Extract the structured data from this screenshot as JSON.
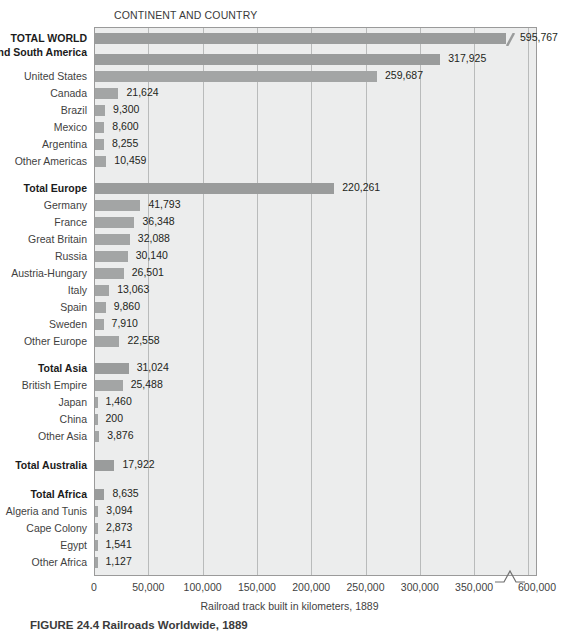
{
  "header": {
    "column_header": "CONTINENT AND COUNTRY"
  },
  "axis": {
    "title": "Railroad track built in kilometers, 1889",
    "tick_labels": [
      "0",
      "50,000",
      "100,000",
      "150,000",
      "200,000",
      "250,000",
      "300,000",
      "350,000",
      "600,000"
    ],
    "has_break": true,
    "break_between": [
      "350,000",
      "600,000"
    ]
  },
  "caption": {
    "text": "FIGURE 24.4  Railroads Worldwide, 1889"
  },
  "chart_data": {
    "type": "bar",
    "orientation": "horizontal",
    "title": "CONTINENT AND COUNTRY",
    "xlabel": "Railroad track built in kilometers, 1889",
    "ylabel": "",
    "xlim": [
      0,
      360000
    ],
    "axis_break": {
      "from": 355000,
      "to": 595000,
      "display_max_label": "600,000"
    },
    "grid": "vertical",
    "legend": "none",
    "xticks": [
      0,
      50000,
      100000,
      150000,
      200000,
      250000,
      300000,
      350000,
      600000
    ],
    "categories": [
      "TOTAL WORLD",
      "Total North and South America",
      "United States",
      "Canada",
      "Brazil",
      "Mexico",
      "Argentina",
      "Other Americas",
      "Total Europe",
      "Germany",
      "France",
      "Great Britain",
      "Russia",
      "Austria-Hungary",
      "Italy",
      "Spain",
      "Sweden",
      "Other Europe",
      "Total Asia",
      "British Empire",
      "Japan",
      "China",
      "Other Asia",
      "Total Australia",
      "Total Africa",
      "Algeria and Tunis",
      "Cape Colony",
      "Egypt",
      "Other Africa"
    ],
    "values": [
      595767,
      317925,
      259687,
      21624,
      9300,
      8600,
      8255,
      10459,
      220261,
      41793,
      36348,
      32088,
      30140,
      26501,
      13063,
      9860,
      7910,
      22558,
      31024,
      25488,
      1460,
      200,
      3876,
      17922,
      8635,
      3094,
      2873,
      1541,
      1127
    ],
    "value_labels": [
      "595,767",
      "317,925",
      "259,687",
      "21,624",
      "9,300",
      "8,600",
      "8,255",
      "10,459",
      "220,261",
      "41,793",
      "36,348",
      "32,088",
      "30,140",
      "26,501",
      "13,063",
      "9,860",
      "7,910",
      "22,558",
      "31,024",
      "25,488",
      "1,460",
      "200",
      "3,876",
      "17,922",
      "8,635",
      "3,094",
      "2,873",
      "1,541",
      "1,127"
    ],
    "colors": {
      "bar": "#a3a5a5",
      "total_bar": "#9a9c9c",
      "plot_background": "#eceded",
      "gridline": "#b9bbbb",
      "frame": "#9a9a9a",
      "text": "#231f20"
    }
  },
  "rows": [
    {
      "label": "TOTAL WORLD",
      "value_label": "595,767",
      "value": 595767,
      "bold": true,
      "truncated": true,
      "gap_before": 0
    },
    {
      "label": "Total North and South America",
      "value_label": "317,925",
      "value": 317925,
      "bold": true,
      "truncated": false,
      "gap_before": 4,
      "two_line": true
    },
    {
      "label": "United States",
      "value_label": "259,687",
      "value": 259687,
      "bold": false,
      "truncated": false,
      "gap_before": 0
    },
    {
      "label": "Canada",
      "value_label": "21,624",
      "value": 21624,
      "bold": false,
      "truncated": false,
      "gap_before": 0
    },
    {
      "label": "Brazil",
      "value_label": "9,300",
      "value": 9300,
      "bold": false,
      "truncated": false,
      "gap_before": 0
    },
    {
      "label": "Mexico",
      "value_label": "8,600",
      "value": 8600,
      "bold": false,
      "truncated": false,
      "gap_before": 0
    },
    {
      "label": "Argentina",
      "value_label": "8,255",
      "value": 8255,
      "bold": false,
      "truncated": false,
      "gap_before": 0
    },
    {
      "label": "Other Americas",
      "value_label": "10,459",
      "value": 10459,
      "bold": false,
      "truncated": false,
      "gap_before": 0
    },
    {
      "label": "Total Europe",
      "value_label": "220,261",
      "value": 220261,
      "bold": true,
      "truncated": false,
      "gap_before": 10
    },
    {
      "label": "Germany",
      "value_label": "41,793",
      "value": 41793,
      "bold": false,
      "truncated": false,
      "gap_before": 0
    },
    {
      "label": "France",
      "value_label": "36,348",
      "value": 36348,
      "bold": false,
      "truncated": false,
      "gap_before": 0
    },
    {
      "label": "Great Britain",
      "value_label": "32,088",
      "value": 32088,
      "bold": false,
      "truncated": false,
      "gap_before": 0
    },
    {
      "label": "Russia",
      "value_label": "30,140",
      "value": 30140,
      "bold": false,
      "truncated": false,
      "gap_before": 0
    },
    {
      "label": "Austria-Hungary",
      "value_label": "26,501",
      "value": 26501,
      "bold": false,
      "truncated": false,
      "gap_before": 0
    },
    {
      "label": "Italy",
      "value_label": "13,063",
      "value": 13063,
      "bold": false,
      "truncated": false,
      "gap_before": 0
    },
    {
      "label": "Spain",
      "value_label": "9,860",
      "value": 9860,
      "bold": false,
      "truncated": false,
      "gap_before": 0
    },
    {
      "label": "Sweden",
      "value_label": "7,910",
      "value": 7910,
      "bold": false,
      "truncated": false,
      "gap_before": 0
    },
    {
      "label": "Other Europe",
      "value_label": "22,558",
      "value": 22558,
      "bold": false,
      "truncated": false,
      "gap_before": 0
    },
    {
      "label": "Total Asia",
      "value_label": "31,024",
      "value": 31024,
      "bold": true,
      "truncated": false,
      "gap_before": 10
    },
    {
      "label": "British Empire",
      "value_label": "25,488",
      "value": 25488,
      "bold": false,
      "truncated": false,
      "gap_before": 0
    },
    {
      "label": "Japan",
      "value_label": "1,460",
      "value": 1460,
      "bold": false,
      "truncated": false,
      "gap_before": 0
    },
    {
      "label": "China",
      "value_label": "200",
      "value": 200,
      "bold": false,
      "truncated": false,
      "gap_before": 0
    },
    {
      "label": "Other Asia",
      "value_label": "3,876",
      "value": 3876,
      "bold": false,
      "truncated": false,
      "gap_before": 0
    },
    {
      "label": "Total Australia",
      "value_label": "17,922",
      "value": 17922,
      "bold": true,
      "truncated": false,
      "gap_before": 12
    },
    {
      "label": "Total Africa",
      "value_label": "8,635",
      "value": 8635,
      "bold": true,
      "truncated": false,
      "gap_before": 12
    },
    {
      "label": "Algeria and Tunis",
      "value_label": "3,094",
      "value": 3094,
      "bold": false,
      "truncated": false,
      "gap_before": 0
    },
    {
      "label": "Cape Colony",
      "value_label": "2,873",
      "value": 2873,
      "bold": false,
      "truncated": false,
      "gap_before": 0
    },
    {
      "label": "Egypt",
      "value_label": "1,541",
      "value": 1541,
      "bold": false,
      "truncated": false,
      "gap_before": 0
    },
    {
      "label": "Other Africa",
      "value_label": "1,127",
      "value": 1127,
      "bold": false,
      "truncated": false,
      "gap_before": 0
    }
  ]
}
